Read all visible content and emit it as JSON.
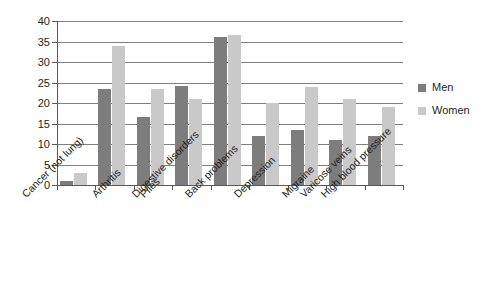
{
  "chart_data": {
    "type": "bar",
    "title": "",
    "subtitle": "",
    "xlabel": "",
    "ylabel": "",
    "ylim": [
      0,
      40
    ],
    "yticks": [
      0,
      5,
      10,
      15,
      20,
      25,
      30,
      35,
      40
    ],
    "grid": true,
    "legend_position": "right",
    "categories": [
      "Cancer (not lung)",
      "Arthritis",
      "Piles",
      "Digestive disorders",
      "Back problems",
      "Depression",
      "Migraine",
      "Varicose veins",
      "High blood pressure"
    ],
    "series": [
      {
        "name": "Men",
        "color": "#7d7d7d",
        "values": [
          1,
          23.5,
          16.5,
          24.2,
          36,
          12,
          13.5,
          11,
          12
        ]
      },
      {
        "name": "Women",
        "color": "#c9c9c9",
        "values": [
          3,
          34,
          23.5,
          21,
          36.5,
          20,
          24,
          21,
          19
        ]
      }
    ]
  },
  "legend": {
    "items": [
      {
        "label": "Men"
      },
      {
        "label": "Women"
      }
    ]
  },
  "caption": {
    "text": ""
  },
  "colors": {
    "men": "#7d7d7d",
    "women": "#c9c9c9",
    "axis": "#58595b",
    "grid": "#808080",
    "text": "#231f20",
    "background": "#ffffff"
  }
}
